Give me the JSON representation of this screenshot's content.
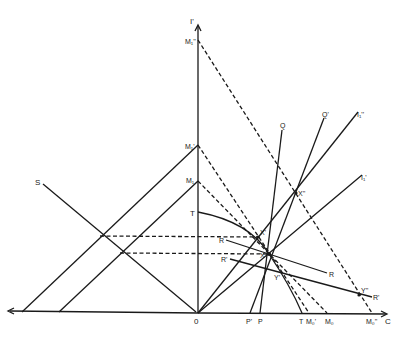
{
  "diagram": {
    "type": "geometric economic diagram",
    "axes": {
      "vertical_label": "I'",
      "horizontal_label": "C",
      "origin_label": "0"
    },
    "vertical_axis_points": [
      {
        "id": "M1pp",
        "label": "M₁''"
      },
      {
        "id": "M1p",
        "label": "M₁'"
      },
      {
        "id": "M1",
        "label": "M₁"
      },
      {
        "id": "T_v",
        "label": "T"
      }
    ],
    "horizontal_axis_points": [
      {
        "id": "Pp",
        "label": "P'"
      },
      {
        "id": "P",
        "label": "P"
      },
      {
        "id": "T_h",
        "label": "T"
      },
      {
        "id": "M0p",
        "label": "M₀'"
      },
      {
        "id": "M0",
        "label": "M₀"
      },
      {
        "id": "M0pp",
        "label": "M₀''"
      }
    ],
    "intersection_points": [
      {
        "id": "X",
        "label": "X"
      },
      {
        "id": "Xp",
        "label": "X'"
      },
      {
        "id": "Xpp",
        "label": "X''"
      },
      {
        "id": "Yp",
        "label": "Y'"
      },
      {
        "id": "Ypp",
        "label": "Y''"
      }
    ],
    "ray_labels": {
      "Q": "Q",
      "Qp": "Q'",
      "I1pp": "I₁''",
      "I1p": "I₁'",
      "S": "S"
    },
    "curve_labels": {
      "R": "R",
      "R_end": "R",
      "Rp": "R'",
      "Rp_end": "R'"
    }
  }
}
